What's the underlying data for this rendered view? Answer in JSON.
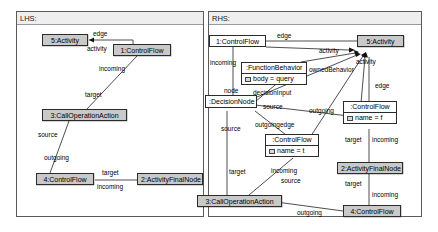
{
  "canvas": {
    "width": 438,
    "height": 232,
    "background": "#ffffff"
  },
  "theme": {
    "node_fill": "#c9c9c9",
    "node_plain_fill": "#ffffff",
    "node_border": "#2b2b2b",
    "panel_border": "#5a5a5a",
    "header_fill": "#eeeeee",
    "edge_color": "#3a3a3a",
    "text_color": "#000000"
  },
  "lhs": {
    "title": "LHS:",
    "nodes": [
      {
        "id": "l5",
        "label": "5:Activity",
        "style": "shaded"
      },
      {
        "id": "l1",
        "label": "1:ControlFlow",
        "style": "shaded"
      },
      {
        "id": "l3",
        "label": "3:CallOperationAction",
        "style": "shaded"
      },
      {
        "id": "l4",
        "label": "4:ControlFlow",
        "style": "shaded"
      },
      {
        "id": "l2",
        "label": "2:ActivityFinalNode",
        "style": "shaded"
      }
    ],
    "edge_labels": [
      {
        "id": "l_edge",
        "text": "edge"
      },
      {
        "id": "l_activity",
        "text": "activity"
      },
      {
        "id": "l_incoming1",
        "text": "incoming"
      },
      {
        "id": "l_target1",
        "text": "target"
      },
      {
        "id": "l_source1",
        "text": "source"
      },
      {
        "id": "l_outgoing1",
        "text": "outgoing"
      },
      {
        "id": "l_target2",
        "text": "target"
      },
      {
        "id": "l_incoming2",
        "text": "incoming"
      }
    ]
  },
  "rhs": {
    "title": "RHS:",
    "nodes": [
      {
        "id": "r1",
        "label": "1:ControlFlow",
        "style": "plain"
      },
      {
        "id": "r5",
        "label": "5:Activity",
        "style": "shaded"
      },
      {
        "id": "rfb",
        "name": ":FunctionBehavior",
        "attribute": "body = query",
        "style": "classifier"
      },
      {
        "id": "rdn",
        "label": ":DecisionNode",
        "style": "plain"
      },
      {
        "id": "rcf_t",
        "name": ":ControlFlow",
        "attribute": "name = t",
        "style": "classifier"
      },
      {
        "id": "rcf_f",
        "name": ":ControlFlow",
        "attribute": "name = f",
        "style": "classifier"
      },
      {
        "id": "r2",
        "label": "2:ActivityFinalNode",
        "style": "shaded"
      },
      {
        "id": "r3",
        "label": "3:CallOperationAction",
        "style": "shaded"
      },
      {
        "id": "r4",
        "label": "4:ControlFlow",
        "style": "shaded"
      }
    ],
    "edge_labels": [
      {
        "id": "r_edge_top",
        "text": "edge"
      },
      {
        "id": "r_activity_1",
        "text": "activity"
      },
      {
        "id": "r_activity_2",
        "text": "activity"
      },
      {
        "id": "r_ownedbehavior",
        "text": "ownedBehavior"
      },
      {
        "id": "r_incoming_left",
        "text": "incoming"
      },
      {
        "id": "r_decisioninput",
        "text": "decisionInput"
      },
      {
        "id": "r_node",
        "text": "node"
      },
      {
        "id": "r_source_mid",
        "text": "source"
      },
      {
        "id": "r_outgoing_mid",
        "text": "outgoing"
      },
      {
        "id": "r_outgoingedge",
        "text": "outgoingedge"
      },
      {
        "id": "r_source_left",
        "text": "source"
      },
      {
        "id": "r_edge_right",
        "text": "edge"
      },
      {
        "id": "r_target_mid",
        "text": "target"
      },
      {
        "id": "r_incoming_right1",
        "text": "incoming"
      },
      {
        "id": "r_target_left",
        "text": "target"
      },
      {
        "id": "r_incoming_mid",
        "text": "incoming"
      },
      {
        "id": "r_source_bottom",
        "text": "source"
      },
      {
        "id": "r_target_right",
        "text": "target"
      },
      {
        "id": "r_incoming_right2",
        "text": "incoming"
      },
      {
        "id": "r_outgoing_bottom",
        "text": "outgoing"
      }
    ]
  }
}
